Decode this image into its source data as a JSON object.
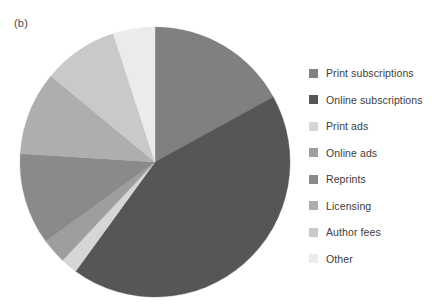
{
  "figure": {
    "panel_label": "(b)"
  },
  "legend": {
    "position": "right",
    "items": [
      {
        "label": "Print subscriptions",
        "color": "#808080"
      },
      {
        "label": "Online subscriptions",
        "color": "#565656"
      },
      {
        "label": "Print ads",
        "color": "#d6d6d6"
      },
      {
        "label": "Online ads",
        "color": "#9e9e9e"
      },
      {
        "label": "Reprints",
        "color": "#8a8a8a"
      },
      {
        "label": "Licensing",
        "color": "#aeaeae"
      },
      {
        "label": "Author fees",
        "color": "#c9c9c9"
      },
      {
        "label": "Other",
        "color": "#ebebeb"
      }
    ]
  },
  "chart_data": {
    "type": "pie",
    "title": "",
    "subtitle": "",
    "xlabel": "",
    "ylabel": "",
    "grid": false,
    "legend_position": "right",
    "start_angle_deg": 0,
    "direction": "clockwise",
    "center": {
      "x": 155,
      "y": 162
    },
    "radius": 135,
    "categories": [
      "Print subscriptions",
      "Online subscriptions",
      "Print ads",
      "Online ads",
      "Reprints",
      "Licensing",
      "Author fees",
      "Other"
    ],
    "values": [
      17,
      43,
      2,
      3,
      11,
      10,
      9,
      5
    ],
    "colors": [
      "#808080",
      "#565656",
      "#d6d6d6",
      "#9e9e9e",
      "#8a8a8a",
      "#aeaeae",
      "#c9c9c9",
      "#ebebeb"
    ],
    "slices": [
      {
        "label": "Print subscriptions",
        "value": 17,
        "start_deg": 0,
        "end_deg": 61.2,
        "color": "#808080"
      },
      {
        "label": "Online subscriptions",
        "value": 43,
        "start_deg": 61.2,
        "end_deg": 216.0,
        "color": "#565656"
      },
      {
        "label": "Print ads",
        "value": 2,
        "start_deg": 216.0,
        "end_deg": 223.2,
        "color": "#d6d6d6"
      },
      {
        "label": "Online ads",
        "value": 3,
        "start_deg": 223.2,
        "end_deg": 234.0,
        "color": "#9e9e9e"
      },
      {
        "label": "Reprints",
        "value": 11,
        "start_deg": 234.0,
        "end_deg": 273.6,
        "color": "#8a8a8a"
      },
      {
        "label": "Licensing",
        "value": 10,
        "start_deg": 273.6,
        "end_deg": 309.6,
        "color": "#aeaeae"
      },
      {
        "label": "Author fees",
        "value": 9,
        "start_deg": 309.6,
        "end_deg": 342.0,
        "color": "#c9c9c9"
      },
      {
        "label": "Other",
        "value": 5,
        "start_deg": 342.0,
        "end_deg": 360.0,
        "color": "#ebebeb"
      }
    ]
  }
}
